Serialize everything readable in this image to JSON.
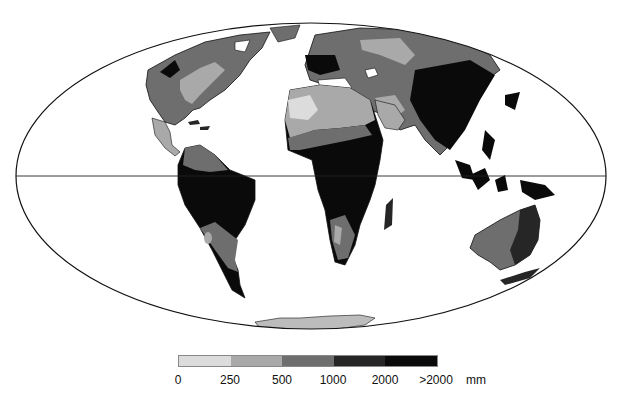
{
  "map": {
    "projection": "Mollweide",
    "variable": "annual precipitation",
    "colors": {
      "c0": "#dcdcdc",
      "c1": "#a9a9a9",
      "c2": "#6e6e6e",
      "c3": "#262626",
      "c4": "#0a0a0a",
      "outline": "#111111"
    }
  },
  "legend": {
    "segments": [
      {
        "range": "0-250",
        "color": "#dcdcdc"
      },
      {
        "range": "250-500",
        "color": "#a9a9a9"
      },
      {
        "range": "500-1000",
        "color": "#6e6e6e"
      },
      {
        "range": "1000-2000",
        "color": "#262626"
      },
      {
        "range": ">2000",
        "color": "#0a0a0a"
      }
    ],
    "tick_labels": [
      "0",
      "250",
      "500",
      "1000",
      "2000",
      ">2000"
    ],
    "unit": "mm"
  }
}
